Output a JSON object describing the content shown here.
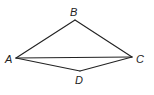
{
  "diagram": {
    "type": "geometry",
    "vertices": [
      {
        "id": "A",
        "label": "A",
        "x": 16,
        "y": 58,
        "lx": 5,
        "ly": 63
      },
      {
        "id": "B",
        "label": "B",
        "x": 75,
        "y": 20,
        "lx": 70,
        "ly": 16
      },
      {
        "id": "C",
        "label": "C",
        "x": 132,
        "y": 57,
        "lx": 136,
        "ly": 63
      },
      {
        "id": "D",
        "label": "D",
        "x": 80,
        "y": 71,
        "lx": 75,
        "ly": 84
      }
    ],
    "edges": [
      [
        "A",
        "B"
      ],
      [
        "B",
        "C"
      ],
      [
        "A",
        "C"
      ],
      [
        "A",
        "D"
      ],
      [
        "D",
        "C"
      ]
    ],
    "colors": {
      "stroke": "#222222",
      "background": "#ffffff"
    }
  }
}
